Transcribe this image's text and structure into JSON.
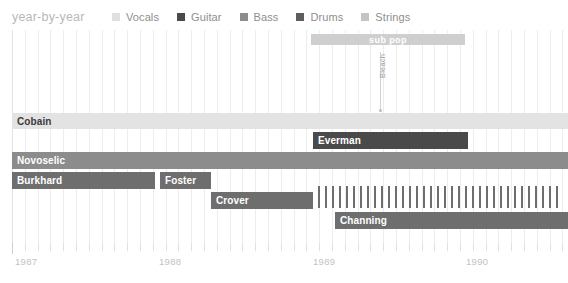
{
  "header": {
    "title": "year-by-year"
  },
  "legend": {
    "items": [
      {
        "label": "Vocals",
        "color": "#e0e0e0"
      },
      {
        "label": "Guitar",
        "color": "#4a4a4a"
      },
      {
        "label": "Bass",
        "color": "#8c8c8c"
      },
      {
        "label": "Drums",
        "color": "#5e5e5e"
      },
      {
        "label": "Strings",
        "color": "#c4c4c4"
      }
    ]
  },
  "annotations": {
    "label_band": {
      "text": "sub pop",
      "color": "#cfcfcf",
      "start": 311,
      "end": 465
    },
    "release_marker": {
      "text": "Bleach",
      "x": 380
    }
  },
  "axis": {
    "years": [
      "1987",
      "1988",
      "1989",
      "1990"
    ],
    "year_x": [
      14,
      158,
      312,
      465
    ],
    "tick_spacing": 12.8,
    "first_tick_x": 12,
    "tick_count": 44
  },
  "chart_data": {
    "type": "bar",
    "title": "year-by-year",
    "xlabel": "",
    "ylabel": "",
    "orientation": "horizontal-timeline",
    "legend_position": "top",
    "grid": true,
    "xlim": [
      "1987",
      "1990.8"
    ],
    "categories": [
      "Cobain",
      "Everman",
      "Novoselic",
      "Burkhard",
      "Foster",
      "Crover",
      "Channing",
      "(interim drummers)"
    ],
    "series": [
      {
        "name": "Cobain",
        "role": "Vocals",
        "color": "#e3e3e3",
        "label_color": "dark",
        "start": 12,
        "end": 568,
        "top": 113,
        "height": 16
      },
      {
        "name": "Everman",
        "role": "Guitar",
        "color": "#4a4a4a",
        "label_color": "light",
        "start": 313,
        "end": 468,
        "top": 132,
        "height": 17
      },
      {
        "name": "Novoselic",
        "role": "Bass",
        "color": "#8c8c8c",
        "label_color": "light",
        "start": 12,
        "end": 568,
        "top": 152,
        "height": 17
      },
      {
        "name": "Burkhard",
        "role": "Drums",
        "color": "#6e6e6e",
        "label_color": "light",
        "start": 12,
        "end": 155,
        "top": 172,
        "height": 17
      },
      {
        "name": "Foster",
        "role": "Drums",
        "color": "#6e6e6e",
        "label_color": "light",
        "start": 160,
        "end": 211,
        "top": 172,
        "height": 17
      },
      {
        "name": "Crover",
        "role": "Drums",
        "color": "#6e6e6e",
        "label_color": "light",
        "start": 211,
        "end": 313,
        "top": 192,
        "height": 17
      },
      {
        "name": "Channing",
        "role": "Drums",
        "color": "#6e6e6e",
        "label_color": "light",
        "start": 335,
        "end": 568,
        "top": 212,
        "height": 17
      }
    ],
    "stripe_band": {
      "name": "interim drummers",
      "role": "Drums",
      "color": "#6e6e6e",
      "start": 318,
      "end": 568,
      "top": 186,
      "height": 22,
      "stripe_spacing": 7,
      "stripe_width": 2
    }
  }
}
